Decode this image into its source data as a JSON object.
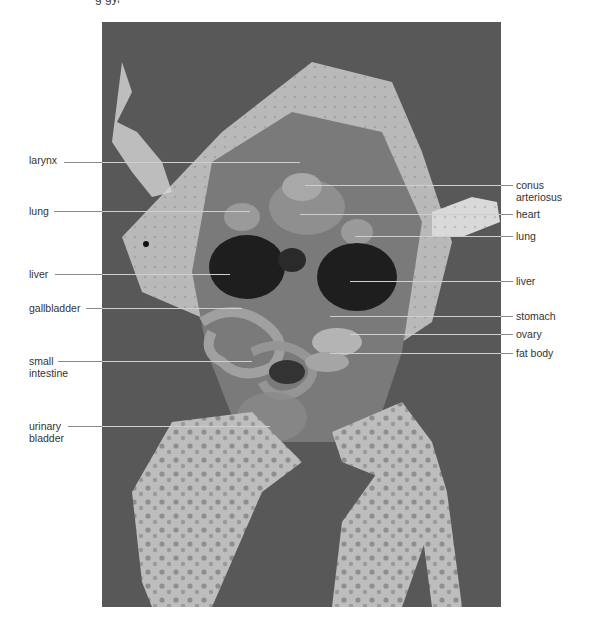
{
  "figure": {
    "caption_partial": "g                               gy,",
    "labels_left": [
      {
        "text": "larynx",
        "y": 162
      },
      {
        "text": "lung",
        "y": 211
      },
      {
        "text": "liver",
        "y": 274
      },
      {
        "text": "gallbladder",
        "y": 308
      },
      {
        "text": "small",
        "text2": "intestine",
        "y": 361
      },
      {
        "text": "urinary",
        "text2": "bladder",
        "y": 426
      }
    ],
    "labels_right": [
      {
        "text": "conus",
        "text2": "arteriosus",
        "y": 185
      },
      {
        "text": "heart",
        "y": 214
      },
      {
        "text": "lung",
        "y": 236
      },
      {
        "text": "liver",
        "y": 281
      },
      {
        "text": "stomach",
        "y": 316
      },
      {
        "text": "ovary",
        "y": 334
      },
      {
        "text": "fat body",
        "y": 353
      }
    ]
  }
}
